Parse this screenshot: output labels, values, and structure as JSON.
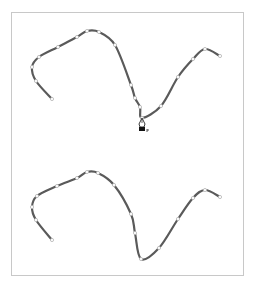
{
  "canvas": {
    "frame": {
      "x": 11,
      "y": 12,
      "width": 233,
      "height": 264,
      "border_color": "#c8c8c8"
    },
    "stroke_color": "#5a5a5a",
    "anchor_fill": "#ffffff",
    "anchor_stroke": "#b4b4b4"
  },
  "paths": [
    {
      "name": "top-path",
      "points": [
        [
          52,
          99
        ],
        [
          36,
          81
        ],
        [
          32,
          67
        ],
        [
          39,
          57
        ],
        [
          58,
          47
        ],
        [
          77,
          37
        ],
        [
          87,
          31
        ],
        [
          99,
          32
        ],
        [
          115,
          45
        ],
        [
          131,
          85
        ],
        [
          135,
          98
        ],
        [
          140,
          107
        ],
        [
          142,
          118
        ],
        [
          161,
          106
        ],
        [
          178,
          77
        ],
        [
          193,
          59
        ],
        [
          205,
          49
        ],
        [
          220,
          56
        ]
      ]
    },
    {
      "name": "bottom-path",
      "points": [
        [
          52,
          240
        ],
        [
          36,
          220
        ],
        [
          32,
          207
        ],
        [
          37,
          196
        ],
        [
          57,
          186
        ],
        [
          77,
          178
        ],
        [
          87,
          172
        ],
        [
          98,
          173
        ],
        [
          114,
          185
        ],
        [
          131,
          214
        ],
        [
          135,
          233
        ],
        [
          141,
          259
        ],
        [
          159,
          248
        ],
        [
          178,
          219
        ],
        [
          193,
          198
        ],
        [
          205,
          190
        ],
        [
          220,
          197
        ]
      ]
    }
  ],
  "cursor": {
    "icon": "pen-tool-cursor-icon",
    "x": 142,
    "y": 118
  },
  "caption": {
    "text": ""
  }
}
